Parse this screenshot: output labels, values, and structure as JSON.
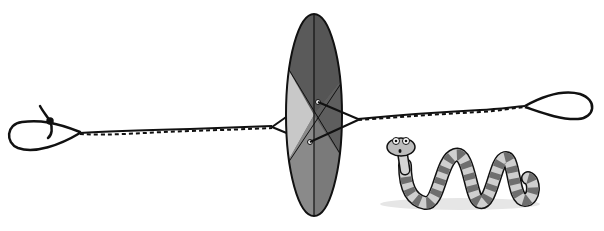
{
  "illustration": {
    "subject": "button whirligig spinner on twisted string with cartoon snake",
    "elements": {
      "disc": {
        "label": "spinning disc",
        "segments": 6,
        "colors": [
          "#5a5a5a",
          "#777777",
          "#c8c8c8",
          "#8a8a8a",
          "#6a6a6a",
          "#9a9a9a"
        ]
      },
      "string": {
        "label": "twisted string with loops at both ends",
        "color": "#1a1a1a"
      },
      "snake": {
        "label": "striped cartoon snake",
        "stripe_dark": "#6e6e6e",
        "stripe_light": "#cfcfcf"
      }
    }
  },
  "colors": {
    "background": "#ffffff",
    "outline": "#111111",
    "shadow": "#e6e6e6"
  }
}
